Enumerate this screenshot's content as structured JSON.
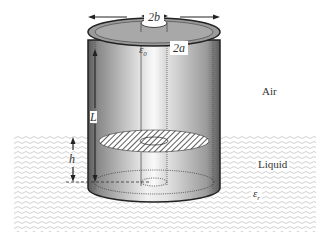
{
  "diagram": {
    "type": "coaxial-capacitor-liquid-level-sensor",
    "labels": {
      "outer_diameter": "2b",
      "inner_diameter": "2a",
      "permittivity_air": "ε",
      "permittivity_air_sub": "0",
      "length": "L",
      "liquid_height": "h",
      "air_region": "Air",
      "liquid_region": "Liquid",
      "permittivity_liquid": "ε",
      "permittivity_liquid_sub": "r"
    },
    "colors": {
      "background": "#ffffff",
      "liquid_wave": "#c8c8c8",
      "cylinder_dark": "#3a3a3a",
      "cylinder_light": "#e8e8e8",
      "outline": "#222222"
    }
  }
}
